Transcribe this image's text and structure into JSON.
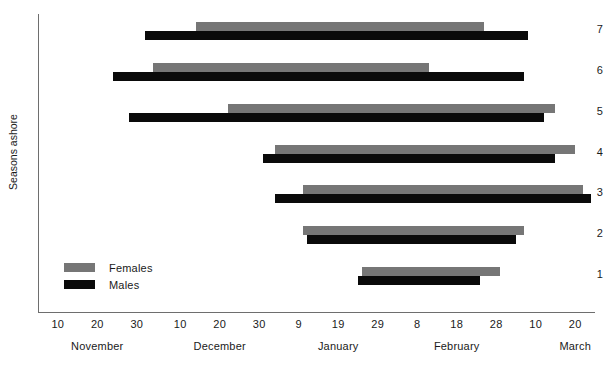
{
  "chart_data": {
    "type": "bar",
    "chart_kind": "horizontal-range-bars",
    "title": "",
    "xlabel": "",
    "ylabel": "Seasons ashore",
    "grid": false,
    "legend_position": "inside-bottom-left",
    "x_axis": {
      "unit": "date",
      "range_start": "November 5",
      "range_end": "March 35",
      "tick_labels": [
        "10",
        "20",
        "30",
        "10",
        "20",
        "30",
        "9",
        "19",
        "29",
        "8",
        "18",
        "28",
        "10",
        "20",
        "30"
      ],
      "tick_days": [
        10,
        20,
        30,
        41,
        51,
        61,
        71,
        81,
        91,
        101,
        111,
        121,
        131,
        141,
        151
      ],
      "month_labels": [
        "November",
        "December",
        "January",
        "February",
        "March"
      ],
      "month_centers_day": [
        20,
        51,
        81,
        111,
        141
      ]
    },
    "y_axis": {
      "tick_labels": [
        "1",
        "2",
        "3",
        "4",
        "5",
        "6",
        "7"
      ],
      "values": [
        1,
        2,
        3,
        4,
        5,
        6,
        7
      ],
      "ylim": [
        0.4,
        7.6
      ]
    },
    "legend": [
      {
        "name": "Females",
        "color": "#767676"
      },
      {
        "name": "Males",
        "color": "#0a0a0a"
      }
    ],
    "series": [
      {
        "name": "Females",
        "color": "#767676",
        "bars": [
          {
            "season": 7,
            "start_day": 45,
            "end_day": 118
          },
          {
            "season": 6,
            "start_day": 34,
            "end_day": 104
          },
          {
            "season": 5,
            "start_day": 53,
            "end_day": 136
          },
          {
            "season": 4,
            "start_day": 65,
            "end_day": 141
          },
          {
            "season": 3,
            "start_day": 72,
            "end_day": 143
          },
          {
            "season": 2,
            "start_day": 72,
            "end_day": 128
          },
          {
            "season": 1,
            "start_day": 87,
            "end_day": 122
          }
        ]
      },
      {
        "name": "Males",
        "color": "#0a0a0a",
        "bars": [
          {
            "season": 7,
            "start_day": 32,
            "end_day": 129
          },
          {
            "season": 6,
            "start_day": 24,
            "end_day": 128
          },
          {
            "season": 5,
            "start_day": 28,
            "end_day": 133
          },
          {
            "season": 4,
            "start_day": 62,
            "end_day": 136
          },
          {
            "season": 3,
            "start_day": 65,
            "end_day": 145
          },
          {
            "season": 2,
            "start_day": 73,
            "end_day": 126
          },
          {
            "season": 1,
            "start_day": 86,
            "end_day": 117
          }
        ]
      }
    ]
  },
  "geometry": {
    "plot_left": 38,
    "plot_right": 595,
    "plot_top": 14,
    "plot_bottom": 312,
    "x_day_min": 5,
    "px_per_day": 3.95,
    "y_positions_px": {
      "7": 29,
      "6": 70,
      "5": 111,
      "4": 152,
      "3": 192,
      "2": 233,
      "1": 274
    },
    "female_offset_px": -7,
    "male_offset_px": 2,
    "bar_height_px": 9
  }
}
